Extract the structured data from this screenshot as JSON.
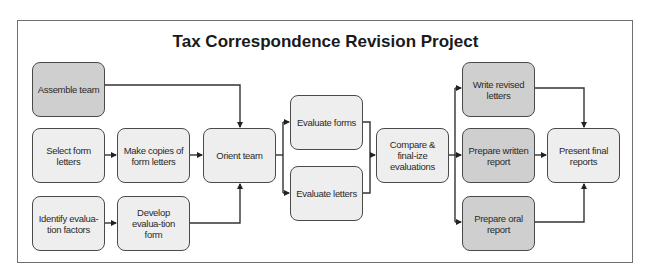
{
  "title": "Tax Correspondence Revision Project",
  "colors": {
    "dark_fill": "#cfcfcf",
    "light_fill": "#eeeeee",
    "stroke": "#4a4a4a",
    "frame": "#707070"
  },
  "nodes": {
    "assemble_team": {
      "label": "Assemble team",
      "shade": "dark"
    },
    "select_form_letters": {
      "label": "Select form letters",
      "shade": "light"
    },
    "make_copies": {
      "label": "Make copies of form letters",
      "shade": "light"
    },
    "identify_factors": {
      "label": "Identify evalua-tion factors",
      "shade": "light"
    },
    "develop_form": {
      "label": "Develop evalua-tion form",
      "shade": "light"
    },
    "orient_team": {
      "label": "Orient team",
      "shade": "light"
    },
    "evaluate_forms": {
      "label": "Evaluate forms",
      "shade": "light"
    },
    "evaluate_letters": {
      "label": "Evaluate letters",
      "shade": "light"
    },
    "compare_finalize": {
      "label": "Compare & final-ize evaluations",
      "shade": "light"
    },
    "write_revised": {
      "label": "Write revised letters",
      "shade": "dark"
    },
    "prepare_written": {
      "label": "Prepare written report",
      "shade": "dark"
    },
    "prepare_oral": {
      "label": "Prepare oral report",
      "shade": "dark"
    },
    "present_final": {
      "label": "Present final reports",
      "shade": "light"
    }
  },
  "edges": [
    [
      "assemble_team",
      "orient_team"
    ],
    [
      "select_form_letters",
      "make_copies"
    ],
    [
      "make_copies",
      "orient_team"
    ],
    [
      "identify_factors",
      "develop_form"
    ],
    [
      "develop_form",
      "orient_team"
    ],
    [
      "orient_team",
      "evaluate_forms"
    ],
    [
      "orient_team",
      "evaluate_letters"
    ],
    [
      "evaluate_forms",
      "compare_finalize"
    ],
    [
      "evaluate_letters",
      "compare_finalize"
    ],
    [
      "compare_finalize",
      "write_revised"
    ],
    [
      "compare_finalize",
      "prepare_written"
    ],
    [
      "compare_finalize",
      "prepare_oral"
    ],
    [
      "write_revised",
      "present_final"
    ],
    [
      "prepare_written",
      "present_final"
    ],
    [
      "prepare_oral",
      "present_final"
    ]
  ]
}
